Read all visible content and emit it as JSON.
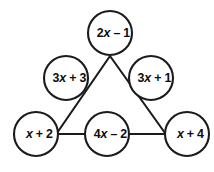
{
  "figure": {
    "kind": "triangle-sum-puzzle",
    "background_color": "#ffffff",
    "line_color": "#1b1b1b",
    "text_color": "#0d0d0d",
    "circle_fill": "#ffffff",
    "circle_radius": 22
  },
  "nodes": [
    {
      "id": "top",
      "position": "top-vertex",
      "label": "2x – 1",
      "coefficient": "2",
      "variable": "x",
      "operator": "–",
      "constant": "1",
      "cx": 110,
      "cy": 33
    },
    {
      "id": "left-middle",
      "position": "left-side-midpoint",
      "label": "3x + 3",
      "coefficient": "3",
      "variable": "x",
      "operator": "+",
      "constant": "3",
      "cx": 66,
      "cy": 78
    },
    {
      "id": "right-middle",
      "position": "right-side-midpoint",
      "label": "3x + 1",
      "coefficient": "3",
      "variable": "x",
      "operator": "+",
      "constant": "1",
      "cx": 151,
      "cy": 78
    },
    {
      "id": "bottom-left",
      "position": "bottom-left-vertex",
      "label": "x + 2",
      "coefficient": "",
      "variable": "x",
      "operator": "+",
      "constant": "2",
      "cx": 36,
      "cy": 134
    },
    {
      "id": "bottom-middle",
      "position": "bottom-side-midpoint",
      "label": "4x – 2",
      "coefficient": "4",
      "variable": "x",
      "operator": "–",
      "constant": "2",
      "cx": 107,
      "cy": 134
    },
    {
      "id": "bottom-right",
      "position": "bottom-right-vertex",
      "label": "x + 4",
      "coefficient": "",
      "variable": "x",
      "operator": "+",
      "constant": "4",
      "cx": 187,
      "cy": 134
    }
  ],
  "edges": [
    {
      "id": "left-edge",
      "from": "top-vertex",
      "to": "bottom-left-vertex",
      "x1": 110,
      "y1": 56,
      "x2": 57,
      "y2": 133
    },
    {
      "id": "right-edge",
      "from": "top-vertex",
      "to": "bottom-right-vertex",
      "x1": 110,
      "y1": 56,
      "x2": 165,
      "y2": 133
    },
    {
      "id": "bottom-edge-left",
      "from": "bottom-left-vertex",
      "to": "bottom-middle",
      "x1": 58,
      "y1": 134,
      "x2": 85,
      "y2": 134
    },
    {
      "id": "bottom-edge-right",
      "from": "bottom-middle",
      "to": "bottom-right-vertex",
      "x1": 129,
      "y1": 134,
      "x2": 165,
      "y2": 134
    }
  ]
}
